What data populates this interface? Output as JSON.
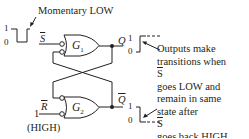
{
  "diagram": {
    "annotation_top": "Momentary LOW",
    "inputs": {
      "s_bar": {
        "label": "S",
        "overbar": true,
        "waveform": {
          "high_label": "1",
          "low_label": "0",
          "description": "Momentary LOW pulse"
        }
      },
      "r_bar": {
        "label": "R",
        "overbar": true,
        "level_value": "1",
        "level_label": "(HIGH)"
      }
    },
    "gates": [
      {
        "id": "G1",
        "label": "G",
        "subscript": "1"
      },
      {
        "id": "G2",
        "label": "G",
        "subscript": "2"
      }
    ],
    "outputs": {
      "q": {
        "label": "Q",
        "high_label": "1",
        "low_label": "0",
        "transition": "0 to 1"
      },
      "q_bar": {
        "label": "Q",
        "overbar": true,
        "high_label": "1",
        "low_label": "0",
        "transition": "1 to 0"
      }
    },
    "note_lines": [
      "Outputs make",
      "transitions when",
      "S goes LOW and",
      "remain in same",
      "state after S",
      "goes back HIGH."
    ],
    "note_overbar_letter": "S",
    "colors": {
      "ink": "#231f20",
      "background": "#ffffff"
    }
  }
}
